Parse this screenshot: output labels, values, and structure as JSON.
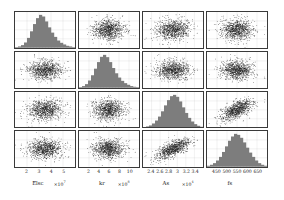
{
  "figure": {
    "kind": "corner-plot",
    "background_color": "#ffffff",
    "hist_fill_color": "#7d7d7d",
    "point_color": "#1a1a1a",
    "grid_color": "#b9b9b9",
    "frame_color": "#3a3a3a"
  },
  "chart_data": {
    "type": "scatter",
    "title": "",
    "grid": true,
    "legend": "none",
    "n_params": 4,
    "parameters": [
      {
        "index": 0,
        "label": "Elsc",
        "multiplier": "×10",
        "exponent": "7",
        "xlabel": "Elsc",
        "ticks": [
          "2",
          "3",
          "4",
          "5"
        ],
        "tick_values": [
          2,
          3,
          4,
          5
        ],
        "range": [
          1.4,
          5.2
        ],
        "mean": 2.75,
        "sigma": 0.45
      },
      {
        "index": 1,
        "label": "kr",
        "multiplier": "×10",
        "exponent": "8",
        "xlabel": "kr",
        "ticks": [
          "2",
          "4",
          "6",
          "8",
          "10"
        ],
        "tick_values": [
          2,
          4,
          6,
          8,
          10
        ],
        "range": [
          1.0,
          11.5
        ],
        "mean": 5.0,
        "sigma": 1.35
      },
      {
        "index": 2,
        "label": "As",
        "multiplier": "×10",
        "exponent": "4",
        "xlabel": "As",
        "ticks": [
          "2.4",
          "2.6",
          "2.8",
          "3",
          "3.2",
          "3.4"
        ],
        "tick_values": [
          2.4,
          2.6,
          2.8,
          3.0,
          3.2,
          3.4
        ],
        "range": [
          2.3,
          3.5
        ],
        "mean": 2.86,
        "sigma": 0.16
      },
      {
        "index": 3,
        "label": "fs",
        "multiplier": "",
        "exponent": "",
        "xlabel": "fs",
        "ticks": [
          "450",
          "500",
          "550",
          "600",
          "650"
        ],
        "tick_values": [
          450,
          500,
          550,
          600,
          650
        ],
        "range": [
          430,
          670
        ],
        "mean": 545,
        "sigma": 42
      }
    ],
    "diagonal_histograms": [
      {
        "parameter": "Elsc",
        "bin_heights": [
          0.02,
          0.04,
          0.08,
          0.16,
          0.3,
          0.5,
          0.72,
          0.9,
          1.0,
          0.95,
          0.8,
          0.62,
          0.46,
          0.33,
          0.22,
          0.15,
          0.1,
          0.06,
          0.04,
          0.02
        ]
      },
      {
        "parameter": "kr",
        "bin_heights": [
          0.02,
          0.05,
          0.11,
          0.22,
          0.38,
          0.58,
          0.78,
          0.94,
          1.0,
          0.93,
          0.78,
          0.6,
          0.44,
          0.31,
          0.21,
          0.14,
          0.09,
          0.05,
          0.03,
          0.02
        ]
      },
      {
        "parameter": "As",
        "bin_heights": [
          0.02,
          0.04,
          0.07,
          0.13,
          0.22,
          0.34,
          0.5,
          0.68,
          0.84,
          0.96,
          1.0,
          0.94,
          0.8,
          0.62,
          0.45,
          0.3,
          0.19,
          0.11,
          0.06,
          0.03
        ]
      },
      {
        "parameter": "fs",
        "bin_heights": [
          0.03,
          0.06,
          0.11,
          0.19,
          0.3,
          0.45,
          0.62,
          0.79,
          0.92,
          1.0,
          0.97,
          0.88,
          0.74,
          0.58,
          0.43,
          0.3,
          0.19,
          0.11,
          0.06,
          0.03
        ]
      }
    ],
    "scatter_panels": [
      {
        "row": 1,
        "col": 0,
        "x": "Elsc",
        "y": "kr",
        "correlation": 0.02,
        "n_points": 900
      },
      {
        "row": 2,
        "col": 0,
        "x": "Elsc",
        "y": "As",
        "correlation": 0.03,
        "n_points": 900
      },
      {
        "row": 3,
        "col": 0,
        "x": "Elsc",
        "y": "fs",
        "correlation": 0.05,
        "n_points": 900
      },
      {
        "row": 0,
        "col": 1,
        "x": "kr",
        "y": "Elsc",
        "correlation": 0.02,
        "n_points": 900
      },
      {
        "row": 2,
        "col": 1,
        "x": "kr",
        "y": "As",
        "correlation": 0.01,
        "n_points": 900
      },
      {
        "row": 3,
        "col": 1,
        "x": "kr",
        "y": "fs",
        "correlation": 0.04,
        "n_points": 900
      },
      {
        "row": 0,
        "col": 2,
        "x": "As",
        "y": "Elsc",
        "correlation": 0.02,
        "n_points": 900
      },
      {
        "row": 1,
        "col": 2,
        "x": "As",
        "y": "kr",
        "correlation": 0.0,
        "n_points": 900
      },
      {
        "row": 3,
        "col": 2,
        "x": "As",
        "y": "fs",
        "correlation": 0.62,
        "n_points": 900
      },
      {
        "row": 0,
        "col": 3,
        "x": "fs",
        "y": "Elsc",
        "correlation": 0.03,
        "n_points": 900
      },
      {
        "row": 1,
        "col": 3,
        "x": "fs",
        "y": "kr",
        "correlation": 0.02,
        "n_points": 900
      },
      {
        "row": 2,
        "col": 3,
        "x": "fs",
        "y": "As",
        "correlation": 0.6,
        "n_points": 900
      }
    ]
  }
}
